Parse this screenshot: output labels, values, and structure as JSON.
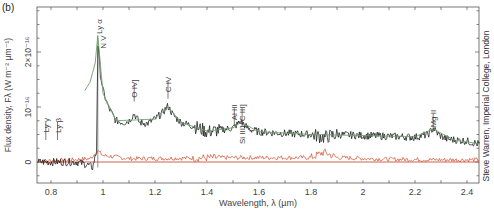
{
  "panel_label": "(b)",
  "credit": "Steve Warren, Imperial College, London",
  "chart_data": {
    "type": "line",
    "title": "",
    "xlabel": "Wavelength, λ (µm)",
    "ylabel": "Flux density, Fλ (W m⁻² µm⁻¹)",
    "xlim": [
      0.75,
      2.45
    ],
    "ylim": [
      -0.4,
      2.8
    ],
    "y_unit_multiplier": "1e-16",
    "x_ticks": [
      0.8,
      1.0,
      1.2,
      1.4,
      1.6,
      1.8,
      2.0,
      2.2,
      2.4
    ],
    "x_tick_labels": [
      "0.8",
      "1",
      "1.2",
      "1.4",
      "1.6",
      "1.8",
      "2",
      "2.2",
      "2.4"
    ],
    "y_ticks": [
      0,
      1,
      2
    ],
    "y_tick_labels": [
      "0",
      "10⁻¹⁶",
      "2×10⁻¹⁶"
    ],
    "grid": false,
    "legend": null,
    "series": [
      {
        "name": "Observed spectrum",
        "color": "#1a1a1a",
        "x": [
          0.75,
          0.8,
          0.85,
          0.9,
          0.94,
          0.96,
          0.975,
          0.98,
          0.985,
          0.99,
          1.0,
          1.02,
          1.05,
          1.08,
          1.1,
          1.12,
          1.14,
          1.17,
          1.2,
          1.23,
          1.25,
          1.27,
          1.3,
          1.35,
          1.4,
          1.45,
          1.5,
          1.53,
          1.56,
          1.6,
          1.7,
          1.8,
          1.85,
          1.9,
          2.0,
          2.1,
          2.2,
          2.25,
          2.27,
          2.29,
          2.32,
          2.4,
          2.45
        ],
        "values": [
          0.0,
          0.0,
          0.0,
          0.0,
          -0.05,
          -0.1,
          0.2,
          2.2,
          1.9,
          1.6,
          1.3,
          1.0,
          0.75,
          0.72,
          0.75,
          0.88,
          0.72,
          0.7,
          0.78,
          0.9,
          1.02,
          0.85,
          0.72,
          0.65,
          0.55,
          0.58,
          0.62,
          0.74,
          0.6,
          0.55,
          0.52,
          0.5,
          0.45,
          0.5,
          0.48,
          0.47,
          0.45,
          0.5,
          0.62,
          0.5,
          0.42,
          0.38,
          0.32
        ]
      },
      {
        "name": "Model fit",
        "color": "#6aa06a",
        "x": [
          0.93,
          0.95,
          0.97,
          0.98,
          1.0,
          1.05,
          1.1,
          1.2,
          1.25,
          1.3,
          1.4,
          1.5,
          1.53,
          1.6,
          1.8,
          2.0,
          2.2,
          2.27,
          2.35,
          2.45
        ],
        "values": [
          1.3,
          1.45,
          1.8,
          2.3,
          1.25,
          0.75,
          0.76,
          0.78,
          1.0,
          0.72,
          0.56,
          0.62,
          0.72,
          0.55,
          0.5,
          0.48,
          0.46,
          0.6,
          0.4,
          0.33
        ]
      },
      {
        "name": "Noise / error",
        "color": "#d04a2a",
        "x": [
          0.75,
          0.85,
          0.95,
          0.98,
          1.0,
          1.1,
          1.3,
          1.5,
          1.8,
          1.85,
          1.9,
          2.1,
          2.3,
          2.45
        ],
        "values": [
          0.02,
          0.03,
          0.06,
          0.2,
          0.12,
          0.06,
          0.07,
          0.08,
          0.08,
          0.18,
          0.08,
          0.05,
          0.04,
          0.04
        ]
      }
    ],
    "annotations": [
      {
        "label": "Ly γ",
        "x": 0.78,
        "y_text": 0.8
      },
      {
        "label": "Ly β",
        "x": 0.825,
        "y_text": 0.8
      },
      {
        "label": "Ly α",
        "x": 0.985,
        "y_text": 2.6
      },
      {
        "label": "N V",
        "x": 1.0,
        "y_text": 2.3
      },
      {
        "label": "O IV]",
        "x": 1.12,
        "y_text": 1.5
      },
      {
        "label": "C IV",
        "x": 1.25,
        "y_text": 1.55
      },
      {
        "label": "Al III",
        "x": 1.505,
        "y_text": 1.05
      },
      {
        "label": "Si III]+C III]",
        "x": 1.535,
        "y_text": 1.05
      },
      {
        "label": "Mg II",
        "x": 2.27,
        "y_text": 0.95
      }
    ],
    "reference_line": {
      "x": 0.98,
      "description": "vertical line at Lyα edge"
    }
  }
}
